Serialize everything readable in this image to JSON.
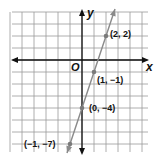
{
  "chart_data": {
    "type": "line",
    "title": "",
    "xlabel": "x",
    "ylabel": "y",
    "origin_label": "O",
    "grid": true,
    "xlim": [
      -6,
      5
    ],
    "ylim": [
      -7.5,
      4
    ],
    "equation_implied": "y = 3x - 4",
    "points": [
      {
        "x": 2,
        "y": 2,
        "label": "(2, 2)"
      },
      {
        "x": 1,
        "y": -1,
        "label": "(1, −1)"
      },
      {
        "x": 0,
        "y": -4,
        "label": "(0, −4)"
      },
      {
        "x": -1,
        "y": -7,
        "label": "(−1, −7)"
      }
    ]
  },
  "layout": {
    "origin_px": [
      82,
      60
    ],
    "unit_px": 12,
    "line_color": "#8a8a8a",
    "axis_color": "#111111",
    "grid_color": "#9a9a9a"
  }
}
